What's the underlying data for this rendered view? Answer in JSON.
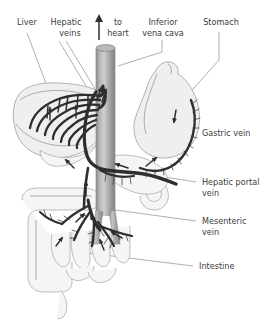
{
  "diagram": {
    "background_color": "#ffffff",
    "label_color": "#3b3b3b",
    "leader_color": "#8d8d8d",
    "vessel_color": "#2e2e2e",
    "organ_fill_color": "#efefef",
    "vena_cava_color": "#9e9e9e"
  },
  "labels": {
    "liver": "Liver",
    "hepatic_veins_line1": "Hepatic",
    "hepatic_veins_line2": "veins",
    "to_heart_line1": "to",
    "to_heart_line2": "heart",
    "inferior_vena_cava_line1": "Inferior",
    "inferior_vena_cava_line2": "vena cava",
    "stomach": "Stomach",
    "gastric_vein": "Gastric vein",
    "hepatic_portal_vein_line1": "Hepatic portal",
    "hepatic_portal_vein_line2": "vein",
    "mesenteric_vein_line1": "Mesenteric",
    "mesenteric_vein_line2": "vein",
    "intestine": "Intestine"
  },
  "icons": {
    "flow_arrow": "blood-flow-arrow",
    "to_heart_arrow": "up-arrow-icon"
  },
  "structures": {
    "liver": "liver-organ",
    "stomach": "stomach-organ",
    "intestine": "intestine-organ",
    "vena_cava": "inferior-vena-cava-vessel",
    "portal_vein": "hepatic-portal-vein-vessel",
    "gastric_vein": "gastric-vein-vessel",
    "mesenteric_vein": "mesenteric-vein-vessel",
    "hepatic_veins": "hepatic-veins-vessel"
  }
}
